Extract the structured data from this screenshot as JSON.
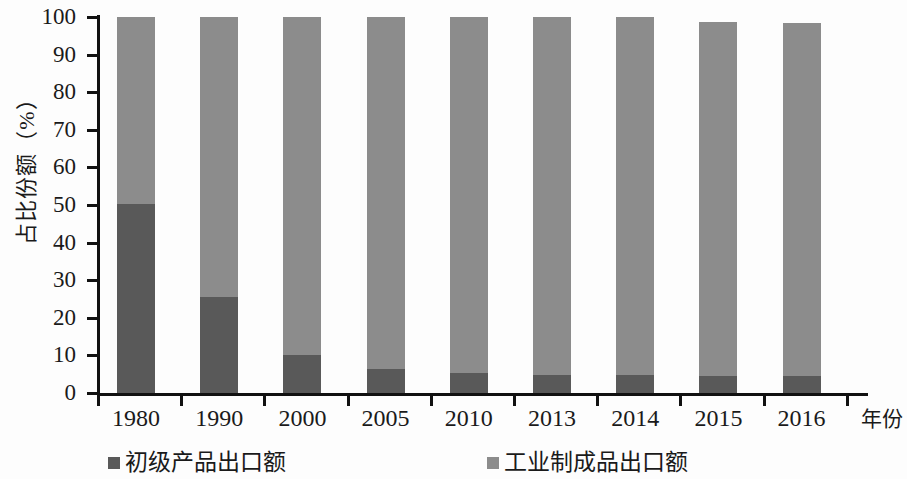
{
  "chart_data": {
    "type": "bar",
    "subtype": "stacked-percentage",
    "title": "",
    "xlabel": "年份",
    "ylabel": "占比份额（%）",
    "categories": [
      "1980",
      "1990",
      "2000",
      "2005",
      "2010",
      "2013",
      "2014",
      "2015",
      "2016"
    ],
    "series": [
      {
        "name": "初级产品出口额",
        "color": "#595959",
        "values": [
          50.3,
          25.6,
          10.2,
          6.4,
          5.2,
          4.9,
          4.8,
          4.4,
          4.4
        ]
      },
      {
        "name": "工业制成品出口额",
        "color": "#8c8c8c",
        "values": [
          49.7,
          74.4,
          89.8,
          93.6,
          94.8,
          95.1,
          95.2,
          94.4,
          94.0
        ]
      }
    ],
    "ylim": [
      0,
      100
    ],
    "ytick_labels": [
      "0",
      "10",
      "20",
      "30",
      "40",
      "50",
      "60",
      "70",
      "80",
      "90",
      "100"
    ],
    "ytick_values": [
      0,
      10,
      20,
      30,
      40,
      50,
      60,
      70,
      80,
      90,
      100
    ],
    "grid": false,
    "legend_position": "bottom"
  },
  "axis": {
    "y_title": "占比份额（%）",
    "x_title": "年份"
  },
  "legend": {
    "items": [
      {
        "label": "初级产品出口额",
        "color": "#595959"
      },
      {
        "label": "工业制成品出口额",
        "color": "#8c8c8c"
      }
    ]
  },
  "colors": {
    "primary_products": "#595959",
    "manufactured_goods": "#8c8c8c",
    "axis": "#111111",
    "background": "#fdfdfd"
  }
}
